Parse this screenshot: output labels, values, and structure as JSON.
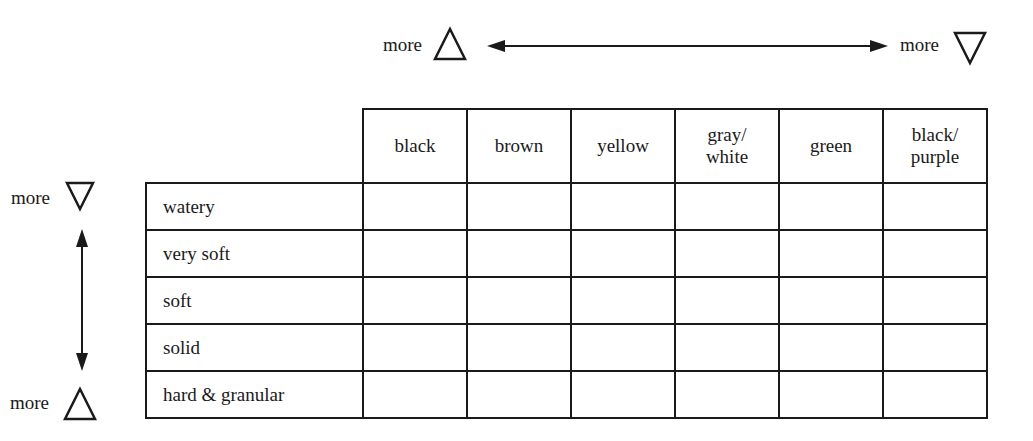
{
  "color_axis": {
    "left_label": "more",
    "left_symbol": "△",
    "right_label": "more",
    "right_symbol": "▽"
  },
  "consistency_axis": {
    "top_label": "more",
    "top_symbol": "▽",
    "bottom_label": "more",
    "bottom_symbol": "△"
  },
  "table": {
    "columns": [
      {
        "line1": "black",
        "line2": ""
      },
      {
        "line1": "brown",
        "line2": ""
      },
      {
        "line1": "yellow",
        "line2": ""
      },
      {
        "line1": "gray/",
        "line2": "white"
      },
      {
        "line1": "green",
        "line2": ""
      },
      {
        "line1": "black/",
        "line2": "purple"
      }
    ],
    "rows": [
      {
        "label": "watery",
        "cells": [
          "",
          "",
          "",
          "",
          "",
          ""
        ]
      },
      {
        "label": "very soft",
        "cells": [
          "",
          "",
          "",
          "",
          "",
          ""
        ]
      },
      {
        "label": "soft",
        "cells": [
          "",
          "",
          "",
          "",
          "",
          ""
        ]
      },
      {
        "label": "solid",
        "cells": [
          "",
          "",
          "",
          "",
          "",
          ""
        ]
      },
      {
        "label": "hard & granular",
        "cells": [
          "",
          "",
          "",
          "",
          "",
          ""
        ]
      }
    ]
  },
  "colors": {
    "ink": "#1a1a1a",
    "background": "#ffffff"
  }
}
